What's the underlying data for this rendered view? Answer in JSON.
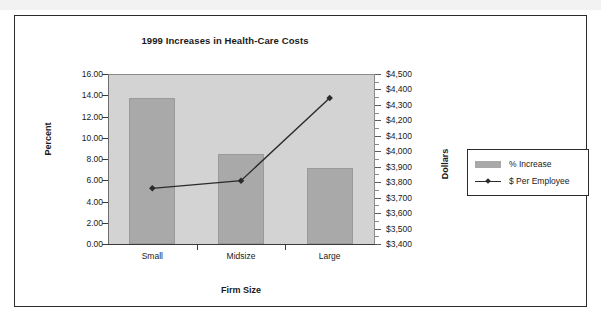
{
  "figure": {
    "title": "1999 Increases in Health-Care Costs",
    "x_axis_title": "Firm Size",
    "y_left_title": "Percent",
    "y_right_title": "Dollars"
  },
  "legend": {
    "items": [
      {
        "label": "% Increase",
        "marker": "bar-swatch",
        "color": "#a9a9a9"
      },
      {
        "label": "$ Per Employee",
        "marker": "line-diamond",
        "color": "#2b2b2b"
      }
    ]
  },
  "colors": {
    "bar_fill": "#a9a9a9",
    "plot_background": "#d3d3d3",
    "line": "#2b2b2b",
    "frame": "#2b2b2b",
    "text": "#1a1a1a"
  },
  "chart_data": {
    "type": "bar",
    "title": "1999 Increases in Health-Care Costs",
    "xlabel": "Firm Size",
    "ylabel": "Percent",
    "y2label": "Dollars",
    "grid": false,
    "legend_position": "right",
    "categories": [
      "Small",
      "Midsize",
      "Large"
    ],
    "series": [
      {
        "name": "% Increase",
        "type": "bar",
        "axis": "left",
        "values": [
          13.7,
          8.5,
          7.2
        ]
      },
      {
        "name": "$ Per Employee",
        "type": "line",
        "axis": "right",
        "values": [
          3760,
          3810,
          4345
        ]
      }
    ],
    "ylim": [
      0.0,
      16.0
    ],
    "ytick_labels": [
      "16.00",
      "14.00",
      "12.00",
      "10.00",
      "8.00",
      "6.00",
      "4.00",
      "2.00",
      "0.00"
    ],
    "ytick_values": [
      16.0,
      14.0,
      12.0,
      10.0,
      8.0,
      6.0,
      4.0,
      2.0,
      0.0
    ],
    "y2lim": [
      3400,
      4500
    ],
    "y2tick_labels": [
      "$4,500",
      "$4,400",
      "$4,300",
      "$4,200",
      "$4,100",
      "$4,000",
      "$3,900",
      "$3,800",
      "$3,700",
      "$3,600",
      "$3,500",
      "$3,400"
    ],
    "y2tick_values": [
      4500,
      4400,
      4300,
      4200,
      4100,
      4000,
      3900,
      3800,
      3700,
      3600,
      3500,
      3400
    ]
  }
}
